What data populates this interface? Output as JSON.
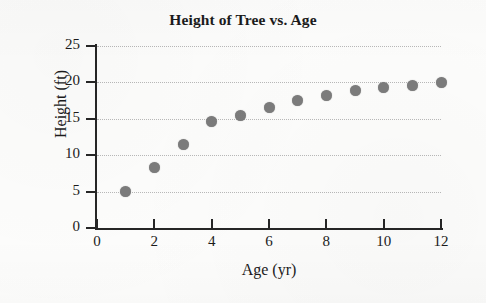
{
  "chart_data": {
    "type": "scatter",
    "title": "Height of Tree vs. Age",
    "xlabel": "Age (yr)",
    "ylabel": "Height (ft)",
    "xlim": [
      0,
      12
    ],
    "ylim": [
      0,
      25
    ],
    "xticks": [
      "0",
      "2",
      "4",
      "6",
      "8",
      "10",
      "12"
    ],
    "xtick_values": [
      0,
      2,
      4,
      6,
      8,
      10,
      12
    ],
    "yticks": [
      "0",
      "5",
      "10",
      "15",
      "20",
      "25"
    ],
    "ytick_values": [
      0,
      5,
      10,
      15,
      20,
      25
    ],
    "grid": "horizontal-dotted",
    "legend": "none",
    "marker_color": "#7c7c7c",
    "axis_color": "#262626",
    "gridline_color": "#b9b9b9",
    "x": [
      1,
      2,
      3,
      4,
      5,
      6,
      7,
      8,
      9,
      10,
      11,
      12
    ],
    "values": [
      5.0,
      8.3,
      11.5,
      14.6,
      15.4,
      16.5,
      17.5,
      18.2,
      18.9,
      19.3,
      19.6,
      20.0
    ],
    "points": [
      {
        "age": 1,
        "height": 5.0
      },
      {
        "age": 2,
        "height": 8.3
      },
      {
        "age": 3,
        "height": 11.5
      },
      {
        "age": 4,
        "height": 14.6
      },
      {
        "age": 5,
        "height": 15.4
      },
      {
        "age": 6,
        "height": 16.5
      },
      {
        "age": 7,
        "height": 17.5
      },
      {
        "age": 8,
        "height": 18.2
      },
      {
        "age": 9,
        "height": 18.9
      },
      {
        "age": 10,
        "height": 19.3
      },
      {
        "age": 11,
        "height": 19.6
      },
      {
        "age": 12,
        "height": 20.0
      }
    ]
  }
}
